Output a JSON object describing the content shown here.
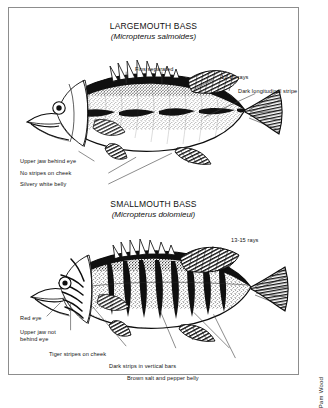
{
  "figure": {
    "type": "illustration-plate",
    "medium": "pen-and-ink scientific illustration",
    "credit": "Pam Wood"
  },
  "panels": [
    {
      "id": "largemouth",
      "common_name": "LARGEMOUTH BASS",
      "scientific_name": "(Micropterus salmoides)",
      "labels": [
        {
          "id": "fins-separated",
          "text": "Fins separated"
        },
        {
          "id": "rays",
          "text": "12-13 rays"
        },
        {
          "id": "dark-stripe",
          "text": "Dark longitudinal stripe"
        },
        {
          "id": "upper-jaw",
          "text": "Upper jaw behind eye"
        },
        {
          "id": "no-stripes",
          "text": "No stripes on cheek"
        },
        {
          "id": "belly",
          "text": "Silvery white belly"
        }
      ]
    },
    {
      "id": "smallmouth",
      "common_name": "SMALLMOUTH BASS",
      "scientific_name": "(Micropterus dolomieui)",
      "labels": [
        {
          "id": "rays",
          "text": "13-15 rays"
        },
        {
          "id": "red-eye",
          "text": "Red eye"
        },
        {
          "id": "upper-jaw",
          "text": "Upper jaw not behind eye"
        },
        {
          "id": "tiger-stripes",
          "text": "Tiger stripes on cheek"
        },
        {
          "id": "vertical-bars",
          "text": "Dark strips in vertical bars"
        },
        {
          "id": "belly",
          "text": "Brown salt and pepper belly"
        }
      ]
    }
  ],
  "colors": {
    "ink": "#111111",
    "frame": "#8d8d8d",
    "paper": "#ffffff"
  }
}
